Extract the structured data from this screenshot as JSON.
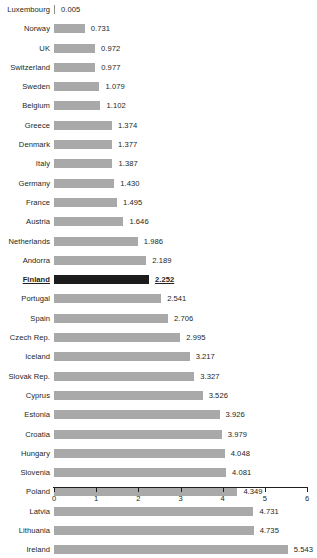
{
  "chart_data": {
    "type": "bar",
    "orientation": "horizontal",
    "title": "",
    "subtitle": "",
    "xlabel": "",
    "ylabel": "",
    "xlim": [
      0,
      6
    ],
    "grid": false,
    "legend": null,
    "legend_position": "none",
    "xticks": [
      "0",
      "1",
      "2",
      "3",
      "4",
      "5",
      "6"
    ],
    "xtick_values": [
      0,
      1,
      2,
      3,
      4,
      5,
      6
    ],
    "categories": [
      "Luxembourg",
      "Norway",
      "UK",
      "Switzerland",
      "Sweden",
      "Belgium",
      "Greece",
      "Denmark",
      "Italy",
      "Germany",
      "France",
      "Austria",
      "Netherlands",
      "Andorra",
      "Finland",
      "Portugal",
      "Spain",
      "Czech Rep.",
      "Iceland",
      "Slovak Rep.",
      "Cyprus",
      "Estonia",
      "Croatia",
      "Hungary",
      "Slovenia",
      "Poland",
      "Latvia",
      "Lithuania",
      "Ireland"
    ],
    "values": [
      0.005,
      0.731,
      0.972,
      0.977,
      1.079,
      1.102,
      1.374,
      1.377,
      1.387,
      1.43,
      1.495,
      1.646,
      1.986,
      2.189,
      2.252,
      2.541,
      2.706,
      2.995,
      3.217,
      3.327,
      3.526,
      3.926,
      3.979,
      4.048,
      4.081,
      4.349,
      4.731,
      4.735,
      5.543
    ],
    "value_labels": [
      "0.005",
      "0.731",
      "0.972",
      "0.977",
      "1.079",
      "1.102",
      "1.374",
      "1.377",
      "1.387",
      "1.430",
      "1.495",
      "1.646",
      "1.986",
      "2.189",
      "2.252",
      "2.541",
      "2.706",
      "2.995",
      "3.217",
      "3.327",
      "3.526",
      "3.926",
      "3.979",
      "4.048",
      "4.081",
      "4.349",
      "4.731",
      "4.735",
      "5.543"
    ],
    "highlighted_category": "Finland",
    "colors": {
      "bar": "#a9a9a9",
      "bar_highlight": "#1c1c1c",
      "text": "#231f20",
      "axis": "#231f20",
      "background": "#ffffff"
    }
  }
}
